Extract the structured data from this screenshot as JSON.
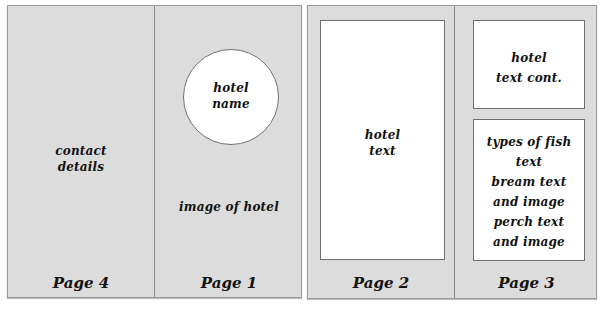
{
  "spreads": [
    {
      "name": "outer-spread",
      "pages": [
        {
          "label": "Page 4",
          "content": [
            "contact",
            "details"
          ]
        },
        {
          "label": "Page 1",
          "circle_text": [
            "hotel",
            "name"
          ],
          "content": [
            "image of hotel"
          ]
        }
      ]
    },
    {
      "name": "inner-spread",
      "pages": [
        {
          "label": "Page 2",
          "box_text": [
            "hotel",
            "text"
          ]
        },
        {
          "label": "Page 3",
          "top_box_text": [
            "hotel",
            "text cont."
          ],
          "bottom_box_text": [
            "types of fish",
            "text",
            "bream text",
            "and image",
            "perch text",
            "and image"
          ]
        }
      ]
    }
  ],
  "colors": {
    "page_bg": "#dcdcdc",
    "box_bg": "#ffffff",
    "border": "#6f6f6f",
    "text": "#111111"
  }
}
